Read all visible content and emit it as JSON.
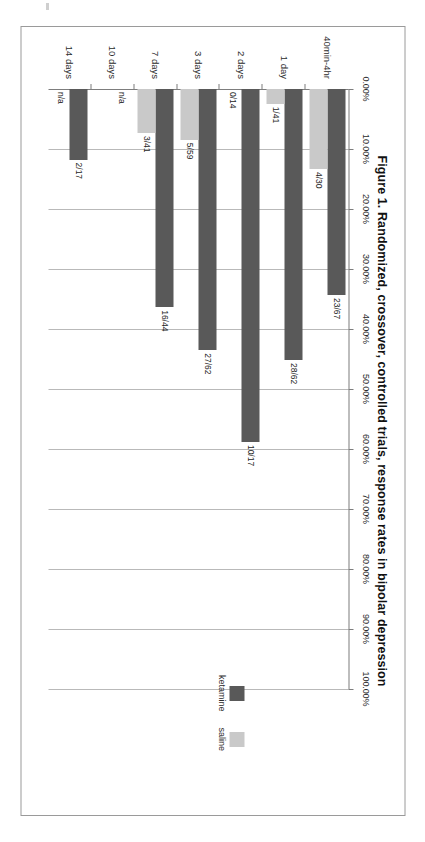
{
  "page": {
    "background": "#ffffff",
    "scan_artifact": true
  },
  "chart_data": {
    "type": "bar",
    "orientation": "horizontal",
    "title": "Figure 1. Randomized, crossover, controlled trials, response rates in bipolar depression",
    "xlabel": "",
    "ylabel": "",
    "xlim": [
      0,
      100
    ],
    "grid": true,
    "legend_position": "right",
    "tick_labels": [
      "0.00%",
      "10.00%",
      "20.00%",
      "30.00%",
      "40.00%",
      "50.00%",
      "60.00%",
      "70.00%",
      "80.00%",
      "90.00%",
      "100.00%"
    ],
    "tick_values": [
      0,
      10,
      20,
      30,
      40,
      50,
      60,
      70,
      80,
      90,
      100
    ],
    "categories": [
      "40min-4hr",
      "1 day",
      "2 days",
      "3 days",
      "7 days",
      "10 days",
      "14 days"
    ],
    "series": [
      {
        "name": "ketamine",
        "color": "#595959",
        "values": [
          34.33,
          45.16,
          58.82,
          43.55,
          36.36,
          null,
          11.76
        ],
        "data_labels": [
          "23/67",
          "28/62",
          "10/17",
          "27/62",
          "16/44",
          "n/a",
          "2/17"
        ]
      },
      {
        "name": "saline",
        "color": "#c9c9c9",
        "values": [
          13.33,
          2.44,
          0,
          8.47,
          7.32,
          null,
          null
        ],
        "data_labels": [
          "4/30",
          "1/41",
          "0/14",
          "5/59",
          "3/41",
          "",
          "n/a"
        ]
      }
    ]
  },
  "legend": {
    "items": [
      {
        "label": "ketamine",
        "color": "#595959"
      },
      {
        "label": "saline",
        "color": "#c9c9c9"
      }
    ]
  }
}
